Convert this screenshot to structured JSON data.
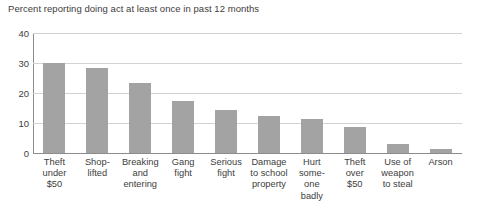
{
  "chart_data": {
    "type": "bar",
    "title": "Percent reporting doing act at least once in past 12 months",
    "xlabel": "",
    "ylabel": "",
    "ylim": [
      0,
      40
    ],
    "yticks": [
      0,
      10,
      20,
      30,
      40
    ],
    "ytick_labels": [
      "0",
      "10",
      "20",
      "30",
      "40"
    ],
    "grid": true,
    "legend": false,
    "orientation": "vertical",
    "bar_color": "#a3a3a3",
    "categories": [
      "Theft under $50",
      "Shoplifted",
      "Breaking and entering",
      "Gang fight",
      "Serious fight",
      "Damage to school property",
      "Hurt someone badly",
      "Theft over $50",
      "Use of weapon to steal",
      "Arson"
    ],
    "category_lines": [
      [
        "Theft",
        "under",
        "$50"
      ],
      [
        "Shop-",
        "lifted"
      ],
      [
        "Breaking",
        "and",
        "entering"
      ],
      [
        "Gang",
        "fight"
      ],
      [
        "Serious",
        "fight"
      ],
      [
        "Damage",
        "to school",
        "property"
      ],
      [
        "Hurt",
        "some-",
        "one",
        "badly"
      ],
      [
        "Theft",
        "over",
        "$50"
      ],
      [
        "Use of",
        "weapon",
        "to steal"
      ],
      [
        "Arson"
      ]
    ],
    "values": [
      30,
      28.5,
      23.5,
      17.5,
      14.5,
      12.5,
      11.5,
      8.8,
      3,
      1.5
    ]
  }
}
